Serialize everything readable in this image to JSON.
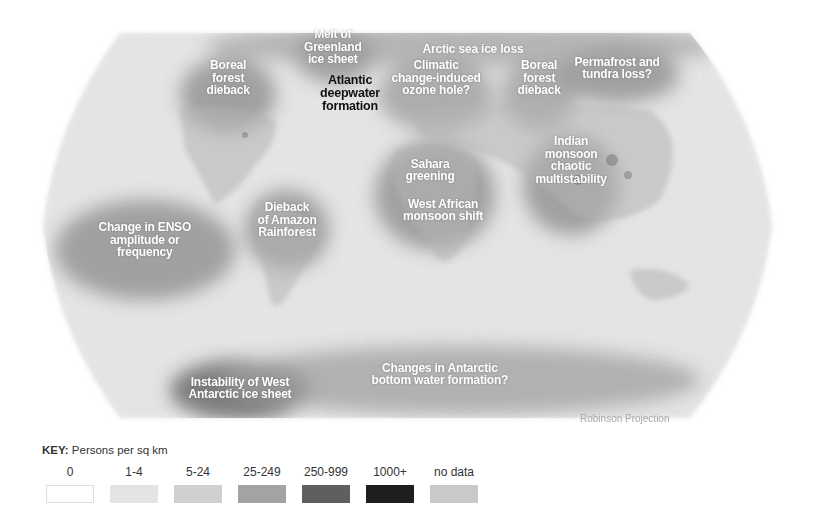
{
  "map": {
    "title": "Climate tipping elements and global population density",
    "projection_label": "Robinson Projection",
    "background_color": "#e6e6e6",
    "labels": [
      {
        "id": "boreal-forest-na",
        "text": [
          "Boreal",
          "forest",
          "dieback"
        ],
        "x": 228,
        "y": 78,
        "style": "light"
      },
      {
        "id": "greenland-melt",
        "text": [
          "Melt of",
          "Greenland",
          "ice sheet"
        ],
        "x": 333,
        "y": 47,
        "style": "light"
      },
      {
        "id": "atlantic-deepwater",
        "text": [
          "Atlantic",
          "deepwater",
          "formation"
        ],
        "x": 350,
        "y": 93,
        "style": "dark"
      },
      {
        "id": "arctic-sea-ice",
        "text": [
          "Arctic sea ice loss"
        ],
        "x": 473,
        "y": 49,
        "style": "light"
      },
      {
        "id": "ozone-hole",
        "text": [
          "Climatic",
          "change-induced",
          "ozone hole?"
        ],
        "x": 436,
        "y": 78,
        "style": "light"
      },
      {
        "id": "boreal-forest-eurasia",
        "text": [
          "Boreal",
          "forest",
          "dieback"
        ],
        "x": 539,
        "y": 78,
        "style": "light"
      },
      {
        "id": "permafrost",
        "text": [
          "Permafrost and",
          "tundra loss?"
        ],
        "x": 617,
        "y": 68,
        "style": "light"
      },
      {
        "id": "sahara-greening",
        "text": [
          "Sahara",
          "greening"
        ],
        "x": 430,
        "y": 170,
        "style": "light"
      },
      {
        "id": "indian-monsoon",
        "text": [
          "Indian",
          "monsoon",
          "chaotic",
          "multistability"
        ],
        "x": 571,
        "y": 160,
        "style": "light"
      },
      {
        "id": "west-african-monsoon",
        "text": [
          "West African",
          "monsoon shift"
        ],
        "x": 443,
        "y": 210,
        "style": "light"
      },
      {
        "id": "amazon-dieback",
        "text": [
          "Dieback",
          "of Amazon",
          "Rainforest"
        ],
        "x": 287,
        "y": 220,
        "style": "light"
      },
      {
        "id": "enso",
        "text": [
          "Change in ENSO",
          "amplitude or",
          "frequency"
        ],
        "x": 145,
        "y": 240,
        "style": "light"
      },
      {
        "id": "west-antarctic-ice",
        "text": [
          "Instability of West",
          "Antarctic ice sheet"
        ],
        "x": 240,
        "y": 388,
        "style": "light"
      },
      {
        "id": "antarctic-bottom-water",
        "text": [
          "Changes in Antarctic",
          "bottom water formation?"
        ],
        "x": 440,
        "y": 374,
        "style": "light"
      }
    ]
  },
  "key": {
    "prefix": "KEY:",
    "title": " Persons per sq km",
    "items": [
      {
        "label": "0",
        "color": "#ffffff",
        "border": "#dddddd"
      },
      {
        "label": "1-4",
        "color": "#e4e4e4",
        "border": "none"
      },
      {
        "label": "5-24",
        "color": "#cfcfcf",
        "border": "none"
      },
      {
        "label": "25-249",
        "color": "#a3a3a3",
        "border": "none"
      },
      {
        "label": "250-999",
        "color": "#5f5f5f",
        "border": "none"
      },
      {
        "label": "1000+",
        "color": "#1e1e1e",
        "border": "none"
      },
      {
        "label": "no data",
        "color": "#c9c9c9",
        "border": "none"
      }
    ]
  }
}
